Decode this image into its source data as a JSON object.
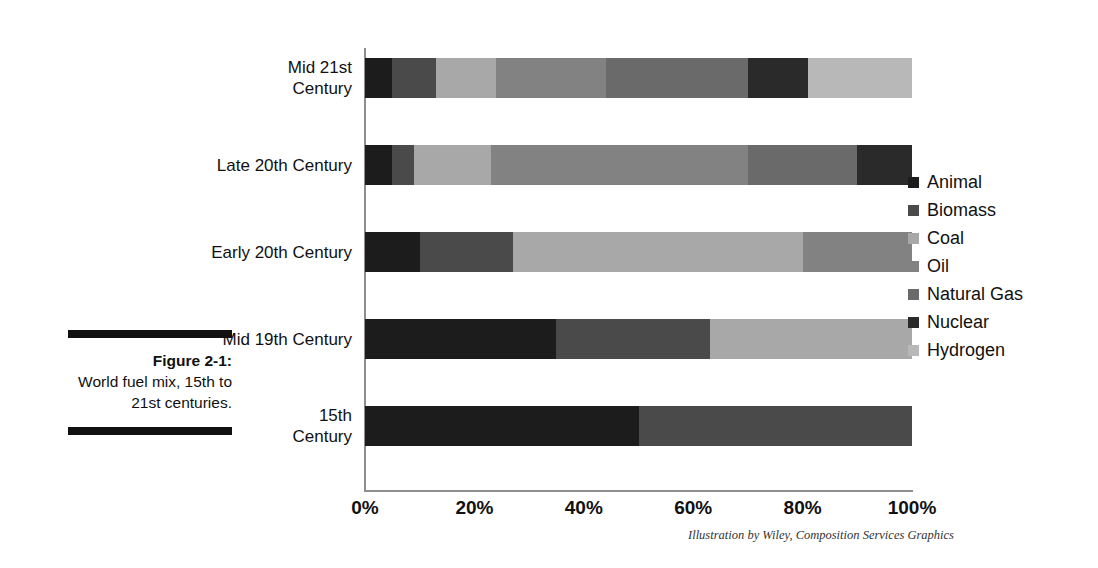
{
  "caption": {
    "label": "Figure 2-1:",
    "body": "World fuel mix, 15th to 21st centuries."
  },
  "credit": "Illustration by Wiley, Composition Services Graphics",
  "legend": {
    "position": "right",
    "items": [
      {
        "label": "Animal",
        "color": "#1c1c1c"
      },
      {
        "label": "Biomass",
        "color": "#4a4a4a"
      },
      {
        "label": "Coal",
        "color": "#a8a8a8"
      },
      {
        "label": "Oil",
        "color": "#828282"
      },
      {
        "label": "Natural Gas",
        "color": "#6a6a6a"
      },
      {
        "label": "Nuclear",
        "color": "#2a2a2a"
      },
      {
        "label": "Hydrogen",
        "color": "#b8b8b8"
      }
    ]
  },
  "axis": {
    "x_ticks": [
      "0%",
      "20%",
      "40%",
      "60%",
      "80%",
      "100%"
    ],
    "x_tick_values": [
      0,
      20,
      40,
      60,
      80,
      100
    ],
    "y_ticks": [
      "Mid 21st\nCentury",
      "Late 20th Century",
      "Early 20th Century",
      "Mid 19th Century",
      "15th\nCentury"
    ]
  },
  "chart_data": {
    "type": "bar",
    "orientation": "horizontal",
    "stacked": true,
    "normalized": true,
    "title": "",
    "subtitle": "",
    "xlabel": "",
    "ylabel": "",
    "xlim": [
      0,
      100
    ],
    "grid": false,
    "legend_position": "right",
    "categories": [
      "Mid 21st Century",
      "Late 20th Century",
      "Early 20th Century",
      "Mid 19th Century",
      "15th Century"
    ],
    "series": [
      {
        "name": "Animal",
        "color": "#1c1c1c",
        "values": [
          5,
          5,
          10,
          35,
          50
        ]
      },
      {
        "name": "Biomass",
        "color": "#4a4a4a",
        "values": [
          8,
          4,
          17,
          28,
          50
        ]
      },
      {
        "name": "Coal",
        "color": "#a8a8a8",
        "values": [
          11,
          14,
          53,
          37,
          0
        ]
      },
      {
        "name": "Oil",
        "color": "#828282",
        "values": [
          20,
          47,
          20,
          0,
          0
        ]
      },
      {
        "name": "Natural Gas",
        "color": "#6a6a6a",
        "values": [
          26,
          20,
          0,
          0,
          0
        ]
      },
      {
        "name": "Nuclear",
        "color": "#2a2a2a",
        "values": [
          11,
          10,
          0,
          0,
          0
        ]
      },
      {
        "name": "Hydrogen",
        "color": "#b8b8b8",
        "values": [
          19,
          0,
          0,
          0,
          0
        ]
      }
    ]
  }
}
